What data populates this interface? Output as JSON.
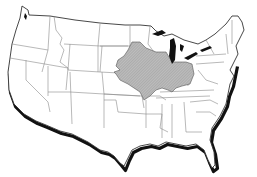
{
  "map": {
    "subject": "United States (contiguous) outline map with state boundaries",
    "highlighted_region": {
      "description": "Shaded hatched region across the Midwest (Iowa, Illinois, Indiana, western Ohio, southern Minnesota, eastern Nebraska, eastern South Dakota, northern Missouri)",
      "fill": "#b8b8b8",
      "stroke": "#555555"
    },
    "colors": {
      "background": "#ffffff",
      "land": "#ffffff",
      "border": "#333333",
      "state_lines": "#888888",
      "shadow": "#111111",
      "great_lakes": "#111111"
    }
  }
}
